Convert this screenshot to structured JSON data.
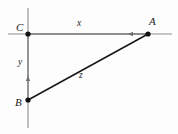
{
  "figure": {
    "background_color": "#fdfdfd",
    "line_color": "#1a1a1a",
    "axis_color": "#8c8c8c",
    "label_color": "#1a1a1a",
    "vertices": [
      {
        "id": "A",
        "label": "A",
        "x": 148,
        "y": 34
      },
      {
        "id": "B",
        "label": "B",
        "x": 28,
        "y": 100
      },
      {
        "id": "C",
        "label": "C",
        "x": 28,
        "y": 34
      }
    ],
    "segments": [
      {
        "id": "x",
        "label": "x",
        "from": "C",
        "to": "A",
        "orientation": "horizontal",
        "arrow": "left"
      },
      {
        "id": "y",
        "label": "y",
        "from": "B",
        "to": "C",
        "orientation": "vertical",
        "arrow": "up"
      },
      {
        "id": "z",
        "label": "z",
        "from": "B",
        "to": "A",
        "orientation": "diagonal",
        "arrow": "none"
      }
    ],
    "axes": {
      "horizontal": {
        "x1": 8,
        "y1": 34,
        "x2": 172,
        "y2": 34
      },
      "vertical": {
        "x1": 28,
        "y1": 8,
        "x2": 28,
        "y2": 128
      }
    }
  }
}
